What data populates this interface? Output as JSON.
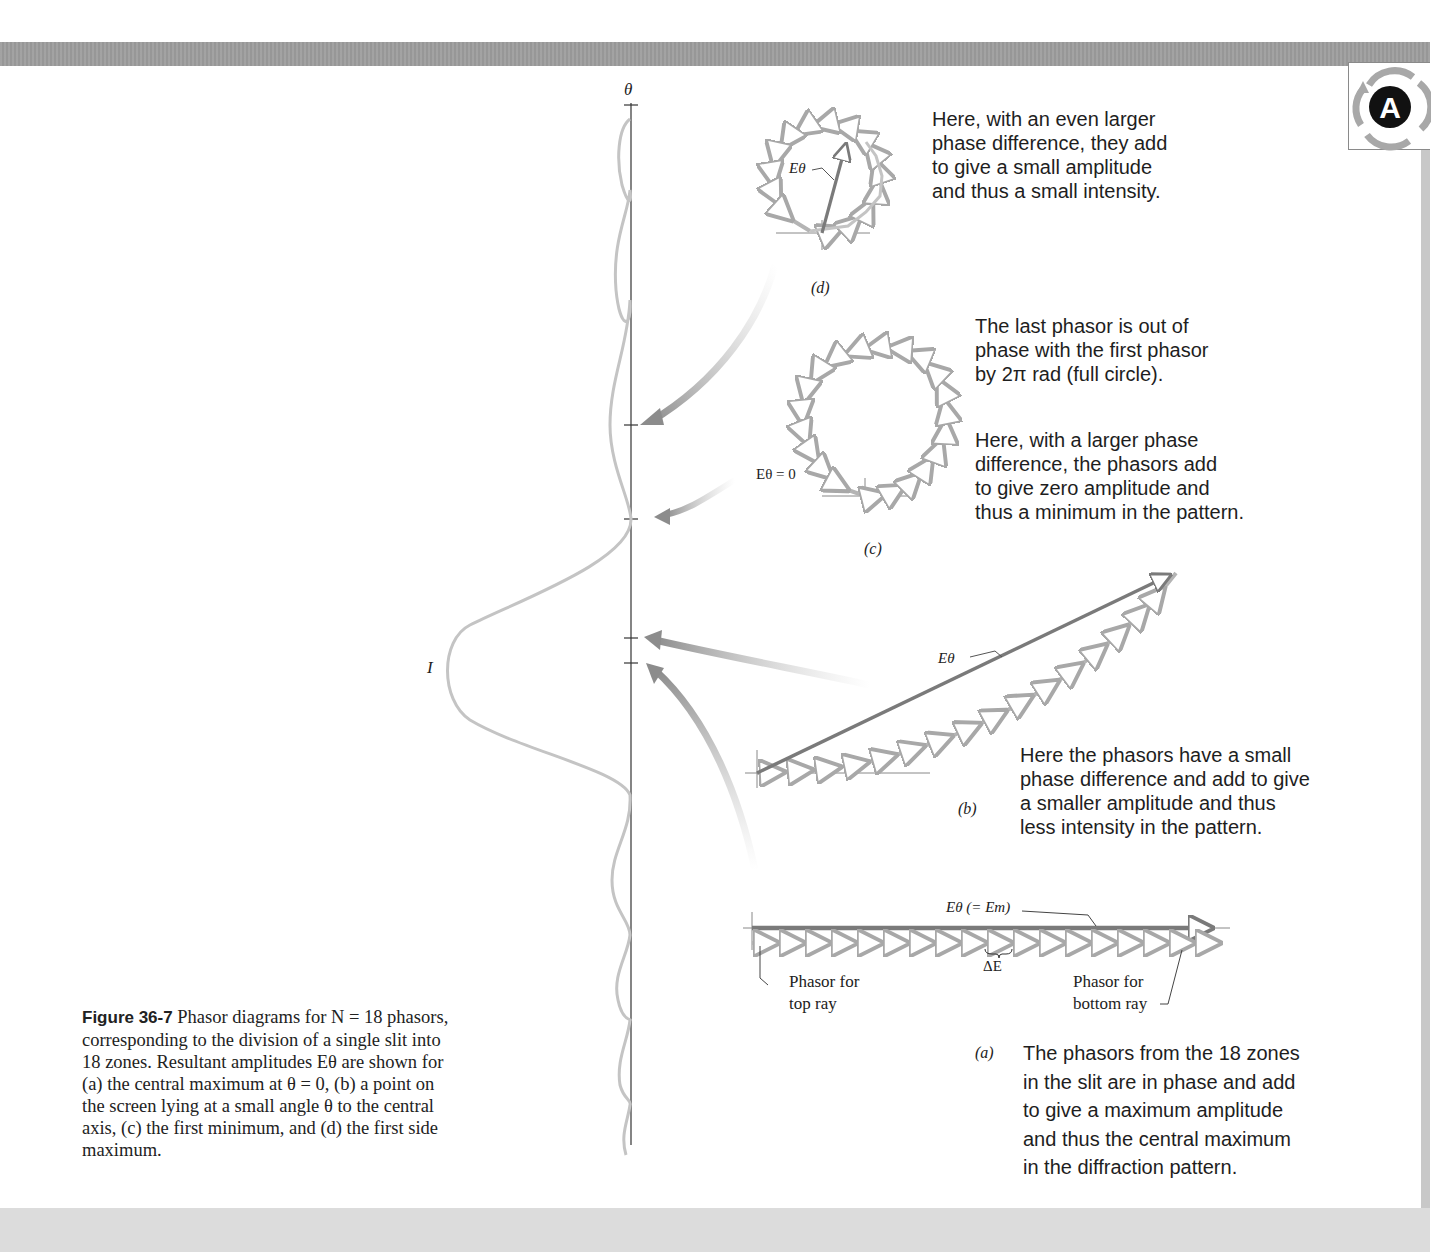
{
  "figure": {
    "number_label": "Figure 36-7",
    "caption_lines": [
      " Phasor diagrams for N = 18 phasors,",
      "corresponding to the division of a single slit into",
      "18 zones. Resultant amplitudes Eθ are shown for",
      "(a) the central maximum at θ = 0, (b) a point on",
      "the screen lying at a small angle θ to the central",
      "axis, (c) the first minimum, and (d) the first side",
      "maximum."
    ],
    "axis_label_theta": "θ",
    "axis_label_intensity": "I"
  },
  "panels": {
    "d": {
      "label": "(d)",
      "resultant_label": "Eθ",
      "note_lines": [
        "Here, with an even larger",
        "phase difference, they add",
        "to give a small amplitude",
        "and thus a small intensity."
      ]
    },
    "c": {
      "label": "(c)",
      "resultant_label": "Eθ = 0",
      "note_top_lines": [
        "The last phasor is out of",
        "phase with the first phasor",
        "by 2π rad (full circle)."
      ],
      "note_bottom_lines": [
        "Here, with a larger phase",
        "difference, the phasors add",
        "to give zero amplitude and",
        "thus a minimum in the pattern."
      ]
    },
    "b": {
      "label": "(b)",
      "resultant_label": "Eθ",
      "note_lines": [
        "Here the phasors have a small",
        "phase difference and add to give",
        "a smaller amplitude and thus",
        "less intensity in the pattern."
      ]
    },
    "a": {
      "label": "(a)",
      "resultant_label": "Eθ (= Em)",
      "delta_label": "ΔE",
      "top_ray_lines": [
        "Phasor for",
        "top ray"
      ],
      "bottom_ray_lines": [
        "Phasor for",
        "bottom ray"
      ],
      "note_lines": [
        "The phasors from the 18 zones",
        "in the slit are in phase and add",
        "to give a maximum amplitude",
        "and thus the central maximum",
        "in the diffraction pattern."
      ]
    }
  },
  "logo": {
    "letter": "A"
  },
  "colors": {
    "phasor_gray": "#b4b4b4",
    "resultant_gray": "#7a7a7a",
    "curve_gray": "#c0c0c0",
    "axis": "#333333",
    "band_gray": "#9d9d9d"
  }
}
